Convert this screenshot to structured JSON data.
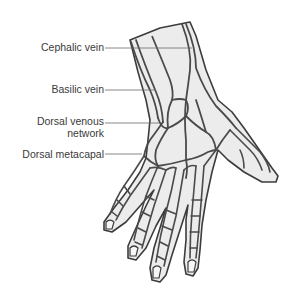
{
  "figure": {
    "colors": {
      "background": "#ffffff",
      "skin_fill": "#ececec",
      "vein_stroke": "#4a4a4a",
      "outline_stroke": "#3c3c3c",
      "leader_line": "#6a6a6a",
      "label_text": "#3a3a3a"
    },
    "labels": [
      {
        "id": "cephalic",
        "text": "Cephalic vein"
      },
      {
        "id": "basilic",
        "text": "Basilic vein"
      },
      {
        "id": "network_line1",
        "text": "Dorsal venous"
      },
      {
        "id": "network_line2",
        "text": "network"
      },
      {
        "id": "metacarpal",
        "text": "Dorsal metacapal"
      }
    ]
  }
}
